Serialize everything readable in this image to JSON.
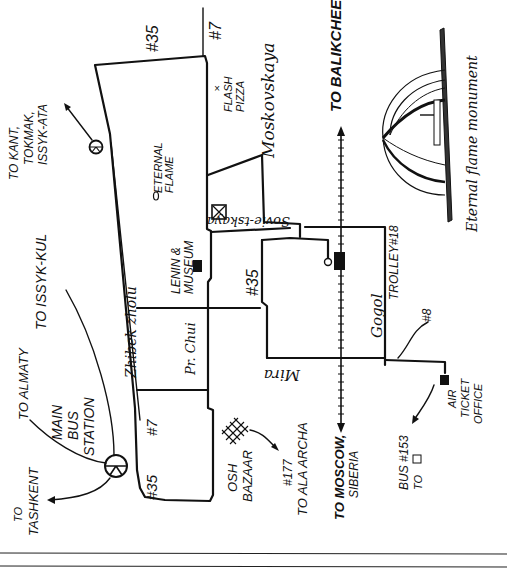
{
  "map": {
    "title": "Eternal flame monument",
    "routes": {
      "bus_35_top": "#35",
      "bus_7_top": "#7",
      "bus_35_mid": "#35",
      "bus_7_bottom": "#7",
      "bus_35_bottom": "#35",
      "bus_8": "#8",
      "trolley_18": "TROLLEY#18"
    },
    "streets": {
      "moskovskaya": "Moskovskaya",
      "sovietskaya": "Sovie-tskaya",
      "zhibek_zholu": "Zhibek zholu",
      "pr_chui": "Pr. Chui",
      "gogol": "Gogol",
      "mira": "Mira"
    },
    "places": {
      "flash_pizza_1": "FLASH",
      "flash_pizza_2": "PIZZA",
      "eternal_flame_1": "ETERNAL",
      "eternal_flame_2": "FLAME",
      "lenin_museum_1": "LENIN &",
      "lenin_museum_2": "MUSEUM",
      "main_bus_station_1": "MAIN",
      "main_bus_station_2": "BUS",
      "main_bus_station_3": "STATION",
      "osh_bazaar_1": "OSH",
      "osh_bazaar_2": "BAZAAR",
      "air_ticket_1": "AIR",
      "air_ticket_2": "TICKET",
      "air_ticket_3": "OFFICE"
    },
    "directions": {
      "kant_1": "TO KANT,",
      "kant_2": "TOKMAK,",
      "kant_3": "ISSYK-ATA",
      "issyk_kul": "TO ISSYK-KUL",
      "almaty": "TO ALMATY",
      "tashkent_1": "TO",
      "tashkent_2": "TASHKENT",
      "balikchee": "TO BALIKCHEE",
      "moscow_1": "TO MOSCOW,",
      "moscow_2": "SIBERIA",
      "ala_archa_1": "#177",
      "ala_archa_2": "TO ALA ARCHA",
      "bus153_1": "BUS #153",
      "bus153_2": "TO"
    },
    "monument_caption": "Eternal flame monument"
  }
}
